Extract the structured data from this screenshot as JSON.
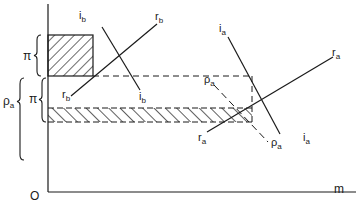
{
  "diagram": {
    "type": "economic-diagram",
    "axes": {
      "origin_label": "O",
      "x_label": "m"
    },
    "lines": {
      "ib": {
        "label_main": "i",
        "label_sub": "b"
      },
      "rb": {
        "label_main": "r",
        "label_sub": "b"
      },
      "ia": {
        "label_main": "i",
        "label_sub": "a"
      },
      "ra": {
        "label_main": "r",
        "label_sub": "a"
      },
      "rho_a": {
        "label_main": "ρ",
        "label_sub": "a"
      }
    },
    "braces": {
      "pi_upper": "π",
      "pi_lower": "π",
      "rho_a_main": "ρ",
      "rho_a_sub": "a"
    },
    "regions": [
      "hatched-box-upper",
      "hatched-strip-lower"
    ],
    "colors": {
      "ink": "#1a1a1a",
      "background": "#ffffff"
    }
  }
}
